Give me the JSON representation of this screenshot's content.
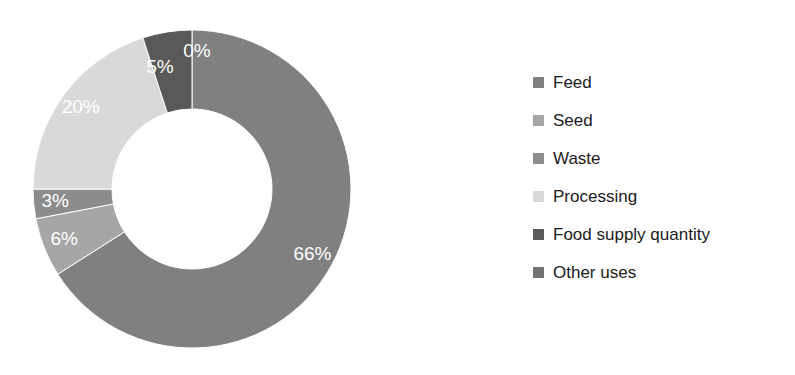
{
  "chart_data": {
    "type": "pie",
    "variant": "donut",
    "title": "",
    "subtitle": "",
    "xlabel": "",
    "ylabel": "",
    "grid": false,
    "legend_position": "right",
    "start_angle_deg": 0,
    "direction": "clockwise",
    "inner_radius_ratio": 0.5,
    "categories": [
      "Feed",
      "Seed",
      "Waste",
      "Processing",
      "Food supply quantity",
      "Other uses"
    ],
    "values": [
      66,
      6,
      3,
      20,
      5,
      0
    ],
    "data_labels": [
      "66%",
      "6%",
      "3%",
      "20%",
      "5%",
      "0%"
    ],
    "colors": [
      "#808080",
      "#a6a6a6",
      "#8c8c8c",
      "#d9d9d9",
      "#595959",
      "#737373"
    ],
    "slices": [
      {
        "name": "Feed",
        "value": 66,
        "label": "66%",
        "color": "#808080"
      },
      {
        "name": "Seed",
        "value": 6,
        "label": "6%",
        "color": "#a6a6a6"
      },
      {
        "name": "Waste",
        "value": 3,
        "label": "3%",
        "color": "#8c8c8c"
      },
      {
        "name": "Processing",
        "value": 20,
        "label": "20%",
        "color": "#d9d9d9"
      },
      {
        "name": "Food supply quantity",
        "value": 5,
        "label": "5%",
        "color": "#595959"
      },
      {
        "name": "Other uses",
        "value": 0,
        "label": "0%",
        "color": "#737373"
      }
    ]
  },
  "legend": {
    "items": [
      {
        "label": "Feed",
        "color": "#808080"
      },
      {
        "label": "Seed",
        "color": "#a6a6a6"
      },
      {
        "label": "Waste",
        "color": "#8c8c8c"
      },
      {
        "label": "Processing",
        "color": "#d9d9d9"
      },
      {
        "label": "Food supply quantity",
        "color": "#595959"
      },
      {
        "label": "Other uses",
        "color": "#737373"
      }
    ]
  },
  "style": {
    "background": "#ffffff",
    "label_text_color": "#ffffff",
    "legend_text_color": "#1a1a1a"
  }
}
